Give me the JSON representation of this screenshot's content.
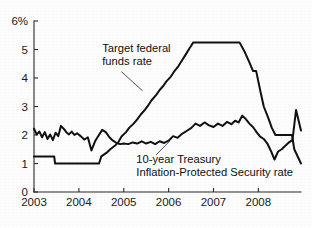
{
  "chart_data": {
    "type": "line",
    "title": "",
    "xlabel": "",
    "ylabel": "",
    "ylim": [
      0,
      6
    ],
    "xlim": [
      2003.0,
      2008.95
    ],
    "grid": false,
    "legend_position": "inline-annotations",
    "y_ticks": [
      0,
      1,
      2,
      3,
      4,
      5,
      6
    ],
    "y_tick_labels": [
      "0",
      "1",
      "2",
      "3",
      "4",
      "5",
      "6%"
    ],
    "x_ticks": [
      2003,
      2004,
      2005,
      2006,
      2007,
      2008
    ],
    "x_tick_labels": [
      "2003",
      "2004",
      "2005",
      "2006",
      "2007",
      "2008"
    ],
    "series": [
      {
        "name": "Target federal funds rate",
        "color": "#111111",
        "label_lines": [
          "Target federal",
          "funds rate"
        ],
        "label_x": 2004.52,
        "label_y": 4.92,
        "leader": [
          [
            2004.95,
            4.22
          ],
          [
            2005.42,
            3.55
          ]
        ],
        "x": [
          2003.0,
          2003.45,
          2003.47,
          2004.45,
          2004.5,
          2004.62,
          2004.7,
          2004.8,
          2004.88,
          2004.95,
          2005.05,
          2005.12,
          2005.22,
          2005.3,
          2005.38,
          2005.47,
          2005.55,
          2005.62,
          2005.72,
          2005.8,
          2005.88,
          2005.95,
          2006.05,
          2006.12,
          2006.22,
          2006.3,
          2006.38,
          2006.47,
          2006.55,
          2007.58,
          2007.7,
          2007.8,
          2007.88,
          2007.95,
          2008.05,
          2008.12,
          2008.22,
          2008.3,
          2008.38,
          2008.47,
          2008.75,
          2008.8,
          2008.95
        ],
        "y": [
          1.25,
          1.25,
          1.0,
          1.0,
          1.25,
          1.38,
          1.5,
          1.62,
          1.75,
          1.95,
          2.1,
          2.25,
          2.4,
          2.55,
          2.72,
          2.88,
          3.05,
          3.22,
          3.4,
          3.58,
          3.72,
          3.88,
          4.05,
          4.22,
          4.42,
          4.62,
          4.82,
          5.05,
          5.25,
          5.25,
          4.9,
          4.55,
          4.25,
          4.25,
          3.5,
          3.0,
          2.6,
          2.25,
          2.0,
          2.0,
          2.0,
          1.5,
          1.0
        ]
      },
      {
        "name": "10-year Treasury Inflation-Protected Security rate",
        "color": "#111111",
        "label_lines": [
          "10-year Treasury",
          "Inflation-Protected Security rate"
        ],
        "label_x": 2005.28,
        "label_y": 1.02,
        "leader": [
          [
            2005.72,
            1.3
          ],
          [
            2006.02,
            1.78
          ]
        ],
        "x": [
          2003.0,
          2003.06,
          2003.12,
          2003.18,
          2003.24,
          2003.3,
          2003.36,
          2003.42,
          2003.48,
          2003.54,
          2003.6,
          2003.66,
          2003.72,
          2003.78,
          2003.84,
          2003.9,
          2003.96,
          2004.04,
          2004.12,
          2004.2,
          2004.28,
          2004.36,
          2004.44,
          2004.52,
          2004.6,
          2004.68,
          2004.76,
          2004.84,
          2004.92,
          2005.0,
          2005.1,
          2005.2,
          2005.3,
          2005.4,
          2005.5,
          2005.6,
          2005.7,
          2005.8,
          2005.9,
          2006.0,
          2006.1,
          2006.2,
          2006.3,
          2006.4,
          2006.5,
          2006.6,
          2006.7,
          2006.8,
          2006.9,
          2007.0,
          2007.1,
          2007.2,
          2007.3,
          2007.4,
          2007.48,
          2007.56,
          2007.64,
          2007.72,
          2007.8,
          2007.88,
          2007.96,
          2008.04,
          2008.12,
          2008.2,
          2008.28,
          2008.36,
          2008.44,
          2008.52,
          2008.6,
          2008.68,
          2008.76,
          2008.84,
          2008.9,
          2008.95
        ],
        "y": [
          2.22,
          2.02,
          2.12,
          1.92,
          2.1,
          1.86,
          2.02,
          1.82,
          2.08,
          1.96,
          2.32,
          2.22,
          2.1,
          2.02,
          2.12,
          2.0,
          2.06,
          1.96,
          1.84,
          1.92,
          1.46,
          1.78,
          1.98,
          2.18,
          2.1,
          1.92,
          1.8,
          1.72,
          1.68,
          1.7,
          1.68,
          1.74,
          1.7,
          1.78,
          1.7,
          1.76,
          1.68,
          1.78,
          1.72,
          1.8,
          1.96,
          1.9,
          2.04,
          2.14,
          2.24,
          2.4,
          2.32,
          2.44,
          2.34,
          2.28,
          2.4,
          2.32,
          2.46,
          2.38,
          2.5,
          2.44,
          2.68,
          2.56,
          2.4,
          2.28,
          2.1,
          1.94,
          1.86,
          1.7,
          1.44,
          1.14,
          1.42,
          1.5,
          1.62,
          1.74,
          1.82,
          2.88,
          2.48,
          2.16
        ]
      }
    ]
  }
}
